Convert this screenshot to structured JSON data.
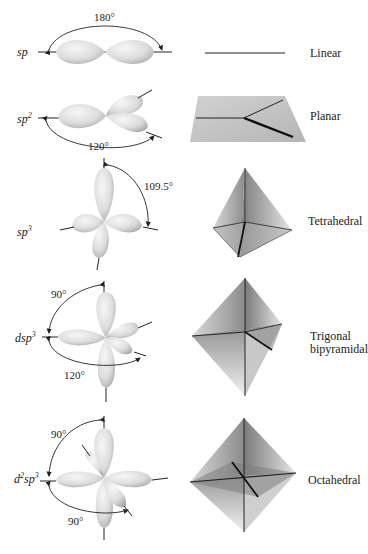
{
  "rows": [
    {
      "hybridization": {
        "base": "sp",
        "prefix": "",
        "prefix_sup": "",
        "sup": ""
      },
      "angles": [
        "180°"
      ],
      "geometry": "Linear"
    },
    {
      "hybridization": {
        "base": "sp",
        "prefix": "",
        "prefix_sup": "",
        "sup": "2"
      },
      "angles": [
        "120°"
      ],
      "geometry": "Planar"
    },
    {
      "hybridization": {
        "base": "sp",
        "prefix": "",
        "prefix_sup": "",
        "sup": "3"
      },
      "angles": [
        "109.5°"
      ],
      "geometry": "Tetrahedral"
    },
    {
      "hybridization": {
        "base": "sp",
        "prefix": "d",
        "prefix_sup": "",
        "sup": "3"
      },
      "angles": [
        "90°",
        "120°"
      ],
      "geometry": "Trigonal bipyramidal",
      "geometry_lines": [
        "Trigonal",
        "bipyramidal"
      ]
    },
    {
      "hybridization": {
        "base": "sp",
        "prefix": "d",
        "prefix_sup": "2",
        "sup": "3"
      },
      "angles": [
        "90°",
        "90°"
      ],
      "geometry": "Octahedral"
    }
  ],
  "colors": {
    "lobe_light": "#f4f4f4",
    "lobe_dark": "#b8b8b8",
    "line": "#1a1a1a",
    "plane": "#bdbdbd"
  }
}
